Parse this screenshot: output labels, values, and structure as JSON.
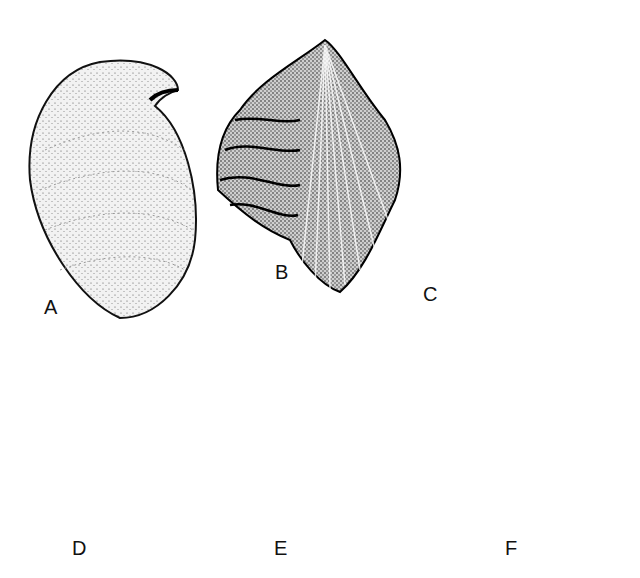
{
  "figure": {
    "panels": [
      {
        "label": "A",
        "subject": "ovate-shell"
      },
      {
        "label": "B",
        "subject": "ribbed-brachiopod"
      },
      {
        "label": "C",
        "subject": "coiled-shell"
      },
      {
        "label": "D",
        "subject": "star-shaped-fossil"
      },
      {
        "label": "E",
        "subject": "conical-cup-fossil"
      },
      {
        "label": "F",
        "subject": "horn-coral"
      }
    ]
  }
}
